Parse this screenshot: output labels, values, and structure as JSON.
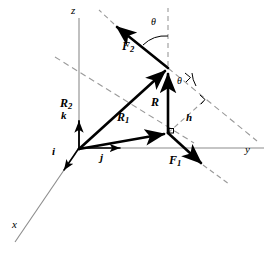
{
  "figure": {
    "type": "vector-diagram-3d",
    "colors": {
      "axis": "#8c8c8c",
      "vector": "#000000",
      "dashed": "#9a9a9a",
      "background": "#ffffff"
    }
  },
  "axes": [
    {
      "name": "z",
      "label": "z",
      "label_x": 71,
      "label_y": 5,
      "from": [
        79,
        148
      ],
      "to": [
        79,
        18
      ]
    },
    {
      "name": "y",
      "label": "y",
      "label_x": 245,
      "label_y": 146,
      "from": [
        79,
        148
      ],
      "to": [
        264,
        148
      ]
    },
    {
      "name": "x",
      "label": "x",
      "label_x": 12,
      "label_y": 220,
      "from": [
        79,
        148
      ],
      "to": [
        15,
        242
      ]
    }
  ],
  "basis_vectors": [
    {
      "name": "i",
      "label": "i",
      "label_x": 53,
      "label_y": 147,
      "from": [
        79,
        148
      ],
      "to": [
        61,
        174
      ]
    },
    {
      "name": "j",
      "label": "j",
      "label_x": 100,
      "label_y": 152,
      "from": [
        79,
        148
      ],
      "to": [
        124,
        148
      ]
    },
    {
      "name": "k",
      "label": "k",
      "label_x": 62,
      "label_y": 110,
      "from": [
        79,
        148
      ],
      "to": [
        79,
        117
      ]
    }
  ],
  "vectors": [
    {
      "name": "R1",
      "label": "R",
      "sub": "1",
      "label_x": 118,
      "label_y": 112,
      "from": [
        79,
        149
      ],
      "to": [
        168,
        133
      ]
    },
    {
      "name": "R2",
      "label": "R",
      "sub": "2",
      "label_x": 61,
      "label_y": 98,
      "from": [
        79,
        149
      ],
      "to": [
        168,
        68
      ]
    },
    {
      "name": "R",
      "label": "R",
      "sub": "",
      "label_x": 152,
      "label_y": 98,
      "from": [
        168,
        133
      ],
      "to": [
        168,
        70
      ]
    },
    {
      "name": "F1",
      "label": "F",
      "sub": "1",
      "label_x": 170,
      "label_y": 157,
      "from": [
        168,
        133
      ],
      "to": [
        204,
        166
      ]
    },
    {
      "name": "F2",
      "label": "F",
      "sub": "2",
      "label_x": 123,
      "label_y": 42,
      "from": [
        168,
        68
      ],
      "to": [
        113,
        23
      ]
    }
  ],
  "dashed_lines": [
    {
      "name": "f2-extension",
      "from": [
        113,
        23
      ],
      "to": [
        99,
        10
      ]
    },
    {
      "name": "f1-extension",
      "from": [
        204,
        166
      ],
      "to": [
        229,
        184
      ]
    },
    {
      "name": "vertical-reference",
      "from": [
        168,
        66
      ],
      "to": [
        168,
        8
      ]
    },
    {
      "name": "plane-diagonal-upper",
      "from": [
        55,
        57
      ],
      "to": [
        194,
        143
      ]
    },
    {
      "name": "plane-diagonal-lower",
      "from": [
        168,
        68
      ],
      "to": [
        257,
        141
      ]
    },
    {
      "name": "moment-arm-h",
      "from": [
        168,
        133
      ],
      "to": [
        206,
        99
      ]
    }
  ],
  "angle_marks": [
    {
      "name": "theta-top",
      "label": "θ",
      "label_x": 152,
      "label_y": 19,
      "cx": 168,
      "cy": 68,
      "r": 32,
      "a1": 219,
      "a2": 270
    },
    {
      "name": "theta-lower",
      "label": "θ",
      "label_x": 178,
      "label_y": 78,
      "cx": 168,
      "cy": 68,
      "r": 30,
      "a1": 0,
      "a2": 39
    }
  ],
  "right_angles": [
    {
      "name": "right-angle-at-base",
      "x": 168,
      "y": 133
    },
    {
      "name": "right-angle-at-h-foot",
      "x": 206,
      "y": 99
    },
    {
      "name": "right-angle-upper",
      "x": 190,
      "y": 78
    }
  ],
  "labels": {
    "h": {
      "text": "h",
      "x": 187,
      "y": 116
    },
    "theta": "θ"
  }
}
